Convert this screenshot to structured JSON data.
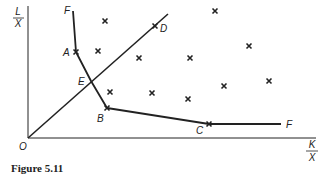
{
  "figure": {
    "caption": "Figure 5.11",
    "y_axis_label": {
      "numerator": "L",
      "denominator": "X"
    },
    "x_axis_label": {
      "numerator": "K",
      "denominator": "X"
    },
    "origin_label": "O",
    "points": {
      "F_top": {
        "label": "F",
        "x": 73,
        "y": 11
      },
      "A": {
        "label": "A",
        "x": 76,
        "y": 52
      },
      "E": {
        "label": "E",
        "x": 91,
        "y": 81
      },
      "B": {
        "label": "B",
        "x": 107,
        "y": 108
      },
      "C": {
        "label": "C",
        "x": 209,
        "y": 124
      },
      "F_right": {
        "label": "F",
        "x": 281,
        "y": 124
      },
      "D": {
        "label": "D",
        "x": 155,
        "y": 26
      }
    },
    "isoquant_path": [
      "F_top",
      "A",
      "E",
      "B",
      "C",
      "F_right"
    ],
    "ray": {
      "from": [
        28,
        138
      ],
      "to": [
        168,
        14
      ]
    },
    "scatter_marks": [
      [
        105,
        21
      ],
      [
        215,
        11
      ],
      [
        98,
        51
      ],
      [
        139,
        58
      ],
      [
        190,
        58
      ],
      [
        249,
        46
      ],
      [
        110,
        92
      ],
      [
        152,
        93
      ],
      [
        188,
        99
      ],
      [
        224,
        86
      ],
      [
        269,
        81
      ]
    ],
    "colors": {
      "ink": "#222222",
      "background": "#ffffff"
    }
  }
}
